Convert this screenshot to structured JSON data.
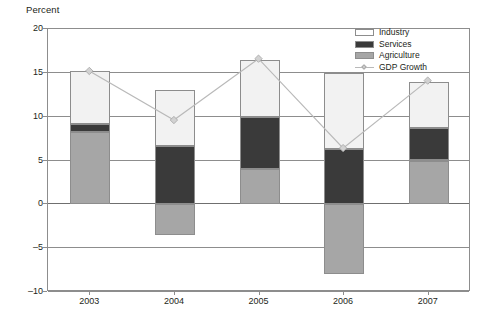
{
  "chart_data": {
    "type": "bar",
    "title": "",
    "subtitle": "",
    "xlabel": "",
    "ylabel": "Percent",
    "ylim": [
      -10,
      20
    ],
    "ytick_values": [
      20,
      15,
      10,
      5,
      0,
      -5,
      -10
    ],
    "ytick_labels": [
      "20",
      "15",
      "10",
      "5",
      "0",
      "-5",
      "-10"
    ],
    "grid": true,
    "stacked": true,
    "legend_position": "top-right",
    "categories": [
      "2003",
      "2004",
      "2005",
      "2006",
      "2007"
    ],
    "series": [
      {
        "name": "Industry",
        "type": "bar",
        "color": "#f2f2f2",
        "values": [
          6.0,
          6.3,
          6.5,
          8.7,
          5.3
        ]
      },
      {
        "name": "Services",
        "type": "bar",
        "color": "#3a3a3a",
        "values": [
          1.0,
          6.7,
          6.0,
          6.3,
          3.7
        ]
      },
      {
        "name": "Agriculture",
        "type": "bar",
        "color": "#a6a6a6",
        "values": [
          8.2,
          -3.5,
          4.0,
          -8.0,
          5.0
        ]
      },
      {
        "name": "GDP Growth",
        "type": "line",
        "color": "#b9b9b9",
        "values": [
          15.1,
          9.5,
          16.5,
          6.3,
          14.0
        ]
      }
    ],
    "stack_tops": [
      15.2,
      13.0,
      16.5,
      15.0,
      14.0
    ],
    "legend": [
      "Industry",
      "Services",
      "Agriculture",
      "GDP Growth"
    ]
  },
  "colors": {
    "industry": "#f2f2f2",
    "services": "#3a3a3a",
    "agriculture": "#a6a6a6",
    "gdp_line": "#b9b9b9",
    "axis": "#8d8d8d",
    "text": "#231f20",
    "background": "#ffffff"
  }
}
